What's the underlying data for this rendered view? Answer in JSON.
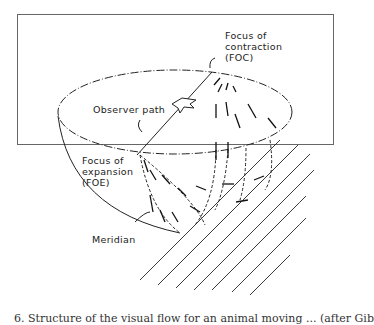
{
  "figure": {
    "labels": {
      "foc_line1": "Focus of",
      "foc_line2": "contraction",
      "foc_line3": "(FOC)",
      "observer_path": "Observer path",
      "foe_line1": "Focus of",
      "foe_line2": "expansion",
      "foe_line3": "(FOE)",
      "meridian": "Meridian"
    },
    "caption": "6. Structure of the visual flow for an animal moving ... (after Gib"
  }
}
